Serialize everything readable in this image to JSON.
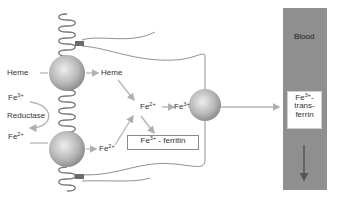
{
  "diagram": {
    "type": "iron absorption in enterocyte",
    "labels": {
      "heme_outside": "Heme",
      "heme_inside": "Heme",
      "fe3_outside": {
        "base": "Fe",
        "sup": "3+"
      },
      "reductase": "Reductase",
      "fe2_outside": {
        "base": "Fe",
        "sup": "2+"
      },
      "fe2_inside_lower": {
        "base": "Fe",
        "sup": "2+"
      },
      "fe2_center": {
        "base": "Fe",
        "sup": "2+"
      },
      "fe3_center": {
        "base": "Fe",
        "sup": "3+"
      },
      "ferritin": {
        "base": "Fe",
        "sup": "3+",
        "suffix": " - ferritin"
      },
      "blood": "Blood",
      "transferrin": {
        "base": "Fe",
        "sup": "3+",
        "line1_suffix": "-",
        "line2": "trans-",
        "line3": "ferrin"
      }
    },
    "colors": {
      "blood": "#8f8f8f",
      "sphere_light": "#e6e6e6",
      "sphere_dark": "#8a8a8a",
      "arrow": "#b4b4b4",
      "membrane": "#7a7a7a",
      "anchor": "#555555"
    }
  }
}
